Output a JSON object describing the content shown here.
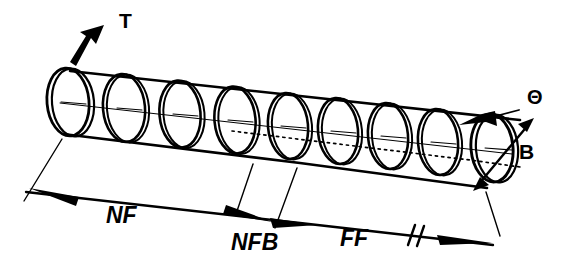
{
  "figure": {
    "kind": "technical-line-diagram",
    "background_color": "#ffffff",
    "ink_color": "#000000",
    "width": 587,
    "height": 273
  },
  "labels": {
    "taper": "T",
    "theta": "Θ",
    "beam_width": "B",
    "near_field": "NF",
    "near_field_boundary": "NFB",
    "far_field": "FF"
  },
  "annotations": [
    {
      "id": "taper-callout",
      "text": "T",
      "x": 119,
      "y": 28,
      "style": "upright",
      "size": 21,
      "leader": "arrow pointing up-right from cylinder top-left rim",
      "interactable": false
    },
    {
      "id": "theta-callout",
      "text": "Θ",
      "x": 527,
      "y": 104,
      "style": "upright",
      "size": 20,
      "leader": "arrow pointing down-left to cylinder top edge",
      "interactable": false
    },
    {
      "id": "beam-width-callout",
      "text": "B",
      "x": 519,
      "y": 159,
      "style": "upright",
      "size": 21,
      "leader": "double-headed diagonal arrow across right end ellipse diameter",
      "interactable": false
    },
    {
      "id": "near-field-dimension-label",
      "text": "NF",
      "x": 106,
      "y": 223,
      "style": "italic",
      "size": 23,
      "leader": "dimension line with arrowheads at both ends",
      "interactable": false
    },
    {
      "id": "near-field-boundary-dimension-label",
      "text": "NFB",
      "x": 231,
      "y": 250,
      "style": "italic",
      "size": 23,
      "leader": "dimension line segment between two tick extension lines",
      "interactable": false
    },
    {
      "id": "far-field-dimension-label",
      "text": "FF",
      "x": 340,
      "y": 246,
      "style": "italic",
      "size": 23,
      "leader": "dimension line with break symbol and arrowhead",
      "interactable": false
    }
  ],
  "geometry": {
    "cylinder": {
      "description": "Slightly tapering cylinder drawn in oblique projection, axis running from upper-left to lower-right",
      "ring_count": 9,
      "ring_note": "Each cross-section drawn as a double-line ellipse with a short centre axis tick",
      "top_edge": "solid line from left rim to right rim",
      "bottom_edge": "solid line on the near side, dotted line on the hidden far side",
      "axis": "thin centre line through every ellipse centre"
    },
    "dimension_lines": {
      "segments": [
        {
          "name": "NF",
          "from": "left rim extension",
          "to": "NFB tick",
          "arrow_start": "left",
          "arrow_end": "right"
        },
        {
          "name": "NFB",
          "from": "NF arrow",
          "to": "FF tick",
          "arrow_start": "left",
          "arrow_end": "right"
        },
        {
          "name": "FF",
          "from": "NFB tick",
          "to": "right rim extension",
          "arrow_end": "right",
          "break_symbol": true
        }
      ]
    }
  }
}
